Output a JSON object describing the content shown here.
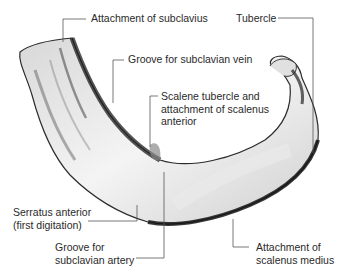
{
  "figure": {
    "labels": [
      {
        "id": "subclavius",
        "lines": [
          "Attachment of subclavius"
        ]
      },
      {
        "id": "tubercle",
        "lines": [
          "Tubercle"
        ]
      },
      {
        "id": "vein",
        "lines": [
          "Groove for subclavian vein"
        ]
      },
      {
        "id": "scalene",
        "lines": [
          "Scalene tubercle and",
          "attachment of scalenus",
          "anterior"
        ]
      },
      {
        "id": "serratus",
        "lines": [
          "Serratus anterior",
          "(first digitation)"
        ]
      },
      {
        "id": "artery",
        "lines": [
          "Groove for",
          "subclavian artery"
        ]
      },
      {
        "id": "medius",
        "lines": [
          "Attachment of",
          "scalenus medius"
        ]
      }
    ],
    "colors": {
      "line": "#555555",
      "bone_light": "#f2f2f2",
      "bone_mid": "#bdbdbd",
      "bone_dark": "#1a1a1a"
    }
  }
}
